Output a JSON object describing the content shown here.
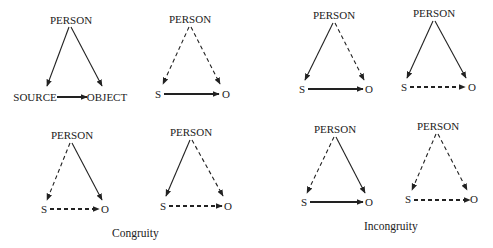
{
  "colors": {
    "ink": "#222222",
    "background": "#ffffff"
  },
  "captions": {
    "congruity": "Congruity",
    "incongruity": "Incongruity"
  },
  "triangles": [
    {
      "group": "congruity",
      "apex_label": "PERSON",
      "left_label": "SOURCE",
      "right_label": "OBJECT",
      "person_to_source": "solid",
      "person_to_object": "solid",
      "source_to_object": "solid"
    },
    {
      "group": "congruity",
      "apex_label": "PERSON",
      "left_label": "S",
      "right_label": "O",
      "person_to_source": "dashed",
      "person_to_object": "dashed",
      "source_to_object": "solid"
    },
    {
      "group": "incongruity",
      "apex_label": "PERSON",
      "left_label": "S",
      "right_label": "O",
      "person_to_source": "solid",
      "person_to_object": "dashed",
      "source_to_object": "solid"
    },
    {
      "group": "incongruity",
      "apex_label": "PERSON",
      "left_label": "S",
      "right_label": "O",
      "person_to_source": "solid",
      "person_to_object": "solid",
      "source_to_object": "dashed"
    },
    {
      "group": "congruity",
      "apex_label": "PERSON",
      "left_label": "S",
      "right_label": "O",
      "person_to_source": "dashed",
      "person_to_object": "solid",
      "source_to_object": "dashed"
    },
    {
      "group": "congruity",
      "apex_label": "PERSON",
      "left_label": "S",
      "right_label": "O",
      "person_to_source": "solid",
      "person_to_object": "dashed",
      "source_to_object": "dashed"
    },
    {
      "group": "incongruity",
      "apex_label": "PERSON",
      "left_label": "S",
      "right_label": "O",
      "person_to_source": "dashed",
      "person_to_object": "solid",
      "source_to_object": "solid"
    },
    {
      "group": "incongruity",
      "apex_label": "PERSON",
      "left_label": "S",
      "right_label": "O",
      "person_to_source": "dashed",
      "person_to_object": "dashed",
      "source_to_object": "dashed"
    }
  ]
}
